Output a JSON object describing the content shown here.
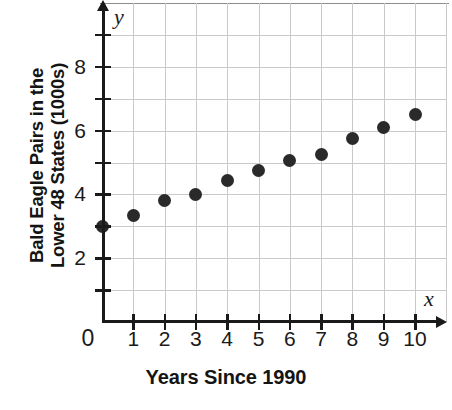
{
  "chart_data": {
    "type": "scatter",
    "title": "",
    "xlabel": "Years Since 1990",
    "ylabel_line1": "Bald Eagle Pairs in the",
    "ylabel_line2": "Lower 48 States (1000s)",
    "ylabel": "Bald Eagle Pairs in the Lower 48 States (1000s)",
    "x_axis_variable": "x",
    "y_axis_variable": "y",
    "origin_label": "0",
    "xlim": [
      0,
      10.7
    ],
    "ylim": [
      0,
      9.85
    ],
    "grid": true,
    "legend": null,
    "x_tick_values": [
      1,
      2,
      3,
      4,
      5,
      6,
      7,
      8,
      9,
      10
    ],
    "x_tick_labels": [
      "1",
      "2",
      "3",
      "4",
      "5",
      "6",
      "7",
      "8",
      "9",
      "10"
    ],
    "y_tick_values": [
      1,
      2,
      3,
      4,
      5,
      6,
      7,
      8,
      9
    ],
    "y_tick_labels": [
      "",
      "2",
      "",
      "4",
      "",
      "6",
      "",
      "8",
      ""
    ],
    "y_labeled_values": [
      2,
      4,
      6,
      8
    ],
    "y_labeled_text": [
      "2",
      "4",
      "6",
      "8"
    ],
    "x": [
      0,
      1,
      2,
      3,
      4,
      5,
      6,
      7,
      8,
      9,
      10
    ],
    "values": [
      3.0,
      3.35,
      3.8,
      4.0,
      4.45,
      4.75,
      5.05,
      5.25,
      5.75,
      6.1,
      6.5
    ],
    "points": [
      {
        "x": 0,
        "y": 3.0
      },
      {
        "x": 1,
        "y": 3.35
      },
      {
        "x": 2,
        "y": 3.8
      },
      {
        "x": 3,
        "y": 4.0
      },
      {
        "x": 4,
        "y": 4.45
      },
      {
        "x": 5,
        "y": 4.75
      },
      {
        "x": 6,
        "y": 5.05
      },
      {
        "x": 7,
        "y": 5.25
      },
      {
        "x": 8,
        "y": 5.75
      },
      {
        "x": 9,
        "y": 6.1
      },
      {
        "x": 10,
        "y": 6.5
      }
    ],
    "marker_color": "#2a2a2a",
    "grid_color": "#c9c9c9",
    "axis_color": "#1a1a1a"
  }
}
